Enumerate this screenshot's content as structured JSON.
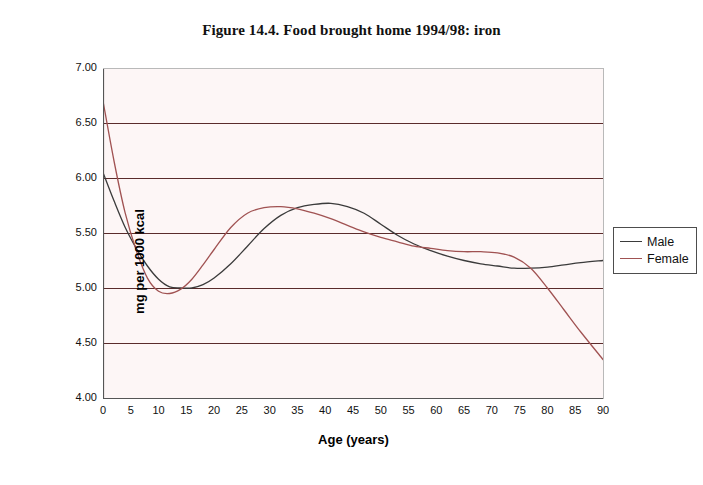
{
  "chart_data": {
    "type": "line",
    "title": "Figure 14.4. Food brought home 1994/98: iron",
    "xlabel": "Age (years)",
    "ylabel": "mg per 1000 kcal",
    "xlim": [
      0,
      90
    ],
    "ylim": [
      4.0,
      7.0
    ],
    "xticks": [
      0,
      5,
      10,
      15,
      20,
      25,
      30,
      35,
      40,
      45,
      50,
      55,
      60,
      65,
      70,
      75,
      80,
      85,
      90
    ],
    "xtick_labels": [
      "0",
      "5",
      "10",
      "15",
      "20",
      "25",
      "30",
      "35",
      "40",
      "45",
      "50",
      "55",
      "60",
      "65",
      "70",
      "75",
      "80",
      "85",
      "90"
    ],
    "yticks": [
      4.0,
      4.5,
      5.0,
      5.5,
      6.0,
      6.5,
      7.0
    ],
    "ytick_labels": [
      "4.00",
      "4.50",
      "5.00",
      "5.50",
      "6.00",
      "6.50",
      "7.00"
    ],
    "grid": "horizontal",
    "legend_position": "right",
    "plot_background": "#fdf6f6",
    "gridline_color": "#5a2b2b",
    "axis_color": "#555555",
    "series": [
      {
        "name": "Male",
        "color": "#3b3b3b",
        "x": [
          0,
          2,
          4,
          6,
          8,
          10,
          12,
          14,
          16,
          18,
          20,
          23,
          26,
          29,
          32,
          35,
          38,
          41,
          44,
          47,
          50,
          53,
          56,
          59,
          62,
          65,
          68,
          71,
          74,
          77,
          80,
          83,
          86,
          90
        ],
        "values": [
          6.05,
          5.79,
          5.55,
          5.36,
          5.2,
          5.08,
          5.01,
          5.0,
          5.0,
          5.03,
          5.09,
          5.22,
          5.38,
          5.54,
          5.66,
          5.73,
          5.76,
          5.77,
          5.74,
          5.68,
          5.58,
          5.48,
          5.4,
          5.34,
          5.29,
          5.25,
          5.22,
          5.2,
          5.18,
          5.18,
          5.19,
          5.21,
          5.23,
          5.25
        ]
      },
      {
        "name": "Female",
        "color": "#a05252",
        "x": [
          0,
          2,
          4,
          6,
          8,
          10,
          12,
          14,
          16,
          18,
          20,
          23,
          26,
          29,
          32,
          35,
          38,
          41,
          44,
          47,
          50,
          53,
          56,
          59,
          62,
          65,
          68,
          71,
          74,
          77,
          80,
          83,
          86,
          90
        ],
        "values": [
          6.7,
          6.15,
          5.68,
          5.34,
          5.09,
          4.97,
          4.95,
          4.99,
          5.08,
          5.21,
          5.35,
          5.55,
          5.68,
          5.73,
          5.74,
          5.72,
          5.68,
          5.63,
          5.57,
          5.51,
          5.46,
          5.42,
          5.38,
          5.36,
          5.34,
          5.33,
          5.33,
          5.32,
          5.28,
          5.18,
          5.0,
          4.8,
          4.6,
          4.35
        ]
      }
    ],
    "annotations": []
  },
  "legend": {
    "items": [
      {
        "label": "Male",
        "color": "#3b3b3b"
      },
      {
        "label": "Female",
        "color": "#a05252"
      }
    ]
  }
}
